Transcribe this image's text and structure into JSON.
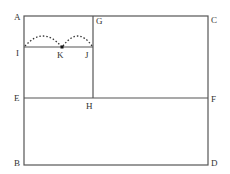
{
  "diagram": {
    "stroke_color": "#555555",
    "label_color": "#333333",
    "points": {
      "A": {
        "label": "A",
        "x": 24,
        "y": 16
      },
      "C": {
        "label": "C",
        "x": 208,
        "y": 16
      },
      "G": {
        "label": "G",
        "x": 93,
        "y": 16
      },
      "I": {
        "label": "I",
        "x": 24,
        "y": 47
      },
      "K": {
        "label": "K",
        "x": 62,
        "y": 47
      },
      "J": {
        "label": "J",
        "x": 93,
        "y": 47
      },
      "E": {
        "label": "E",
        "x": 24,
        "y": 98
      },
      "H": {
        "label": "H",
        "x": 93,
        "y": 98
      },
      "F": {
        "label": "F",
        "x": 208,
        "y": 98
      },
      "B": {
        "label": "B",
        "x": 24,
        "y": 165
      },
      "D": {
        "label": "D",
        "x": 208,
        "y": 165
      }
    },
    "segments": [
      "AC",
      "CD",
      "DB",
      "BA",
      "GH",
      "IJ",
      "EF"
    ],
    "arcs": [
      {
        "from": "I",
        "to": "K",
        "style": "dotted"
      },
      {
        "from": "K",
        "to": "J",
        "style": "dotted"
      }
    ],
    "marked_point": "K"
  }
}
